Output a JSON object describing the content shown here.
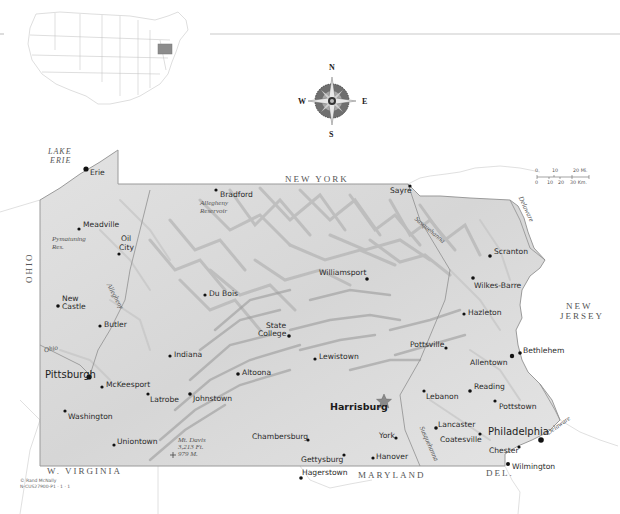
{
  "map": {
    "title": "Pennsylvania",
    "inset": {
      "highlighted_state": "Pennsylvania"
    },
    "compass": {
      "n": "N",
      "s": "S",
      "e": "E",
      "w": "W"
    },
    "scale": {
      "miles_ticks": [
        "0",
        "10",
        "20 Mi."
      ],
      "km_ticks": [
        "0",
        "10",
        "20",
        "30 Km."
      ]
    },
    "neighbors": {
      "new_york": "NEW YORK",
      "ohio": "OHIO",
      "new_jersey_line1": "NEW",
      "new_jersey_line2": "JERSEY",
      "west_virginia": "W. VIRGINIA",
      "maryland": "MARYLAND",
      "delaware": "DEL."
    },
    "water": {
      "lake_erie_line1": "LAKE",
      "lake_erie_line2": "ERIE",
      "pymatuning_line1": "Pymatuning",
      "pymatuning_line2": "Res.",
      "allegheny_res_line1": "Allegheny",
      "allegheny_res_line2": "Reservoir"
    },
    "rivers": {
      "allegheny": "Allegheny",
      "ohio": "Ohio",
      "susquehanna_north": "Susquehanna",
      "susquehanna_south": "Susquehanna",
      "delaware_north": "Delaware",
      "delaware_south": "Delaware"
    },
    "peak": {
      "line1": "Mt. Davis",
      "line2": "3,213 Ft.",
      "line3": "979 M."
    },
    "capital": "Harrisburg",
    "cities": {
      "erie": "Erie",
      "meadville": "Meadville",
      "oil_city_1": "Oil",
      "oil_city_2": "City",
      "bradford": "Bradford",
      "sayre": "Sayre",
      "scranton": "Scranton",
      "wilkes_barre": "Wilkes-Barre",
      "hazleton": "Hazleton",
      "williamsport": "Williamsport",
      "du_bois": "Du Bois",
      "new_castle_1": "New",
      "new_castle_2": "Castle",
      "butler": "Butler",
      "state_college_1": "State",
      "state_college_2": "College",
      "indiana": "Indiana",
      "lewistown": "Lewistown",
      "pottsville": "Pottsville",
      "allentown": "Allentown",
      "bethlehem": "Bethlehem",
      "pittsburgh": "Pittsburgh",
      "mckeesport": "McKeesport",
      "altoona": "Altoona",
      "latrobe": "Latrobe",
      "johnstown": "Johnstown",
      "reading": "Reading",
      "lebanon": "Lebanon",
      "pottstown": "Pottstown",
      "washington": "Washington",
      "lancaster": "Lancaster",
      "coatesville": "Coatesville",
      "philadelphia": "Philadelphia",
      "york": "York",
      "chester": "Chester",
      "uniontown": "Uniontown",
      "chambersburg": "Chambersburg",
      "gettysburg": "Gettysburg",
      "hanover": "Hanover",
      "hagerstown": "Hagerstown",
      "wilmington": "Wilmington"
    },
    "copyright": {
      "line1": "© Rand McNally",
      "line2": "N-CUS27900-P1 · 1 · 1"
    },
    "colors": {
      "land": "#dcdcdc",
      "border": "#9a9a9a",
      "relief": "#b4b4b4",
      "capital_star": "#8a8a8a"
    }
  }
}
